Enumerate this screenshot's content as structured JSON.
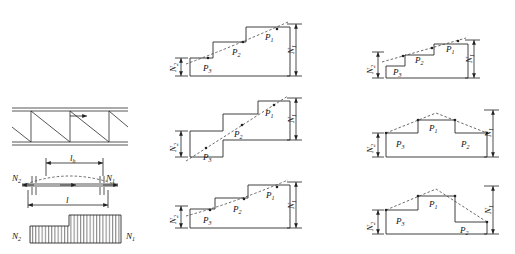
{
  "figure": {
    "type": "engineering-diagram",
    "stroke_color": "#2b2b2b",
    "dash_color": "#444444",
    "hatch_color": "#333333"
  },
  "labels": {
    "N1": "N",
    "N1_sub": "1",
    "N2": "N",
    "N2_sub": "2",
    "P1": "P",
    "P1_sub": "1",
    "P2": "P",
    "P2_sub": "2",
    "P3": "P",
    "P3_sub": "3",
    "l": "l",
    "lh": "l",
    "lh_sub": "h"
  },
  "left_column": {
    "truss": {
      "name": "truss-elevation",
      "panels": 3,
      "chord_style": "double-line",
      "diagonal_direction": "descending-right",
      "arrow_label": "force-direction-arrow"
    },
    "member": {
      "name": "member-with-deflection",
      "span_label": "l",
      "inner_span_label": "lh",
      "left_force": "N2",
      "right_force": "N1",
      "deflection_curve": "dashed-arc"
    },
    "force_block": {
      "name": "stepped-force-block",
      "left_label": "N2",
      "right_label": "N1",
      "hatch": "vertical",
      "steps": [
        {
          "label": "N2",
          "height_ratio": 0.45
        },
        {
          "label": "N1",
          "height_ratio": 1.0
        }
      ]
    }
  },
  "diagrams": [
    {
      "id": "top-center",
      "name": "stepped-ascending-curved",
      "shape": "ascending-staircase",
      "baseline": true,
      "envelope": "dashed-curve",
      "steps": [
        {
          "label": "P3",
          "sub": "3",
          "level": 1
        },
        {
          "label": "P2",
          "sub": "2",
          "level": 2
        },
        {
          "label": "P1",
          "sub": "1",
          "level": 3
        }
      ],
      "left_dim": "N2",
      "right_dim": "N1"
    },
    {
      "id": "top-right",
      "name": "stepped-ascending-low-first-step",
      "shape": "ascending-staircase-shallow",
      "baseline": true,
      "envelope": "dashed-line",
      "steps": [
        {
          "label": "P3",
          "sub": "3",
          "level": 1
        },
        {
          "label": "P2",
          "sub": "2",
          "level": 2
        },
        {
          "label": "P1",
          "sub": "1",
          "level": 3
        }
      ],
      "left_dim": "N2",
      "right_dim": "N1"
    },
    {
      "id": "mid-center",
      "name": "stepped-ascending-open-base",
      "shape": "ascending-staircase-open",
      "baseline": false,
      "envelope": "dashed-line",
      "steps": [
        {
          "label": "P3",
          "sub": "3",
          "level": 1
        },
        {
          "label": "P2",
          "sub": "2",
          "level": 2
        },
        {
          "label": "P1",
          "sub": "1",
          "level": 3
        }
      ],
      "left_dim": "N2",
      "right_dim": "N1"
    },
    {
      "id": "mid-right",
      "name": "symmetric-arch-stepped",
      "shape": "symmetric-peak",
      "baseline": true,
      "envelope": "dashed-peak",
      "steps": [
        {
          "label": "P3",
          "sub": "3",
          "level": 1
        },
        {
          "label": "P1",
          "sub": "1",
          "level": 2
        },
        {
          "label": "P2",
          "sub": "2",
          "level": 1
        }
      ],
      "left_dim": "N2",
      "right_dim": "N1"
    },
    {
      "id": "bottom-center",
      "name": "stepped-ascending-curved-2",
      "shape": "ascending-staircase",
      "baseline": true,
      "envelope": "dashed-curve",
      "steps": [
        {
          "label": "P3",
          "sub": "3",
          "level": 1
        },
        {
          "label": "P2",
          "sub": "2",
          "level": 2
        },
        {
          "label": "P1",
          "sub": "1",
          "level": 3
        }
      ],
      "left_dim": "N2",
      "right_dim": "N1"
    },
    {
      "id": "bottom-right",
      "name": "asymmetric-arch-stepped",
      "shape": "asymmetric-peak",
      "baseline": true,
      "envelope": "dashed-peak",
      "steps": [
        {
          "label": "P3",
          "sub": "3",
          "level": 1
        },
        {
          "label": "P1",
          "sub": "1",
          "level": 2
        },
        {
          "label": "P2",
          "sub": "2",
          "level": 0
        }
      ],
      "left_dim": "N2",
      "right_dim": "N1"
    }
  ]
}
